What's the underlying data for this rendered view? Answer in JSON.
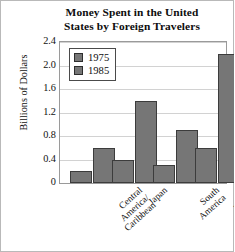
{
  "chart_data": {
    "type": "bar",
    "title": "Money Spent in the United States by Foreign Travelers",
    "title_lines": [
      "Money Spent in the United",
      "States by Foreign Travelers"
    ],
    "xlabel": "",
    "ylabel": "Billions of Dollars",
    "categories": [
      "Central America/Caribbean",
      "Japan",
      "South America",
      "Western Europe"
    ],
    "category_lines": [
      [
        "Central",
        "America/",
        "Caribbean"
      ],
      [
        "Japan"
      ],
      [
        "South",
        "America"
      ],
      [
        "Western",
        "Europe"
      ]
    ],
    "series": [
      {
        "name": "1975",
        "values": [
          0.2,
          0.4,
          0.3,
          0.6
        ],
        "color": "#767676"
      },
      {
        "name": "1985",
        "values": [
          0.6,
          1.4,
          0.9,
          2.2
        ],
        "color": "#767676"
      }
    ],
    "ylim": [
      0,
      2.4
    ],
    "yticks": [
      0,
      0.4,
      0.8,
      1.2,
      1.6,
      2.0,
      2.4
    ],
    "ytick_labels": [
      "0",
      "0.4",
      "0.8",
      "1.2",
      "1.6",
      "2.0",
      "2.4"
    ],
    "grid": true,
    "grid_axis": "y",
    "legend_position": "top-left",
    "legend_entries": [
      "1975",
      "1985"
    ],
    "bar_edge_color": "#3c3c3c",
    "plot_border_color": "#9a9a9a",
    "background_color": "#ffffff"
  }
}
